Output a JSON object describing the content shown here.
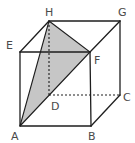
{
  "diagram": {
    "type": "cube",
    "vertices": {
      "A": {
        "label": "A",
        "x": 20,
        "y": 126
      },
      "B": {
        "label": "B",
        "x": 91,
        "y": 126
      },
      "C": {
        "label": "C",
        "x": 120,
        "y": 95
      },
      "D": {
        "label": "D",
        "x": 49,
        "y": 95
      },
      "E": {
        "label": "E",
        "x": 20,
        "y": 52
      },
      "F": {
        "label": "F",
        "x": 90,
        "y": 52
      },
      "G": {
        "label": "G",
        "x": 120,
        "y": 21
      },
      "H": {
        "label": "H",
        "x": 49,
        "y": 21
      }
    },
    "visible_edges": [
      "AB",
      "BF",
      "FE",
      "EA",
      "EH",
      "HG",
      "GF",
      "GC",
      "CB"
    ],
    "hidden_edges": [
      "HD",
      "DC",
      "DA"
    ],
    "shaded_face": {
      "vertices": [
        "A",
        "H",
        "F"
      ],
      "fill": "#c6c6c6"
    },
    "colors": {
      "line": "#1e1e1e",
      "label": "#4a4a4a",
      "shade": "#c6c6c6"
    }
  }
}
